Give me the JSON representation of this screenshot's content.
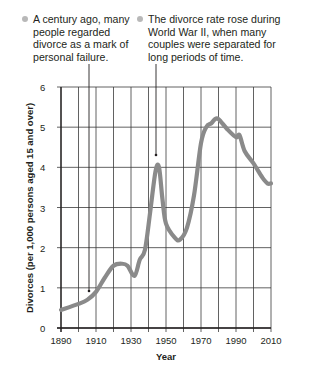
{
  "chart_data": {
    "type": "line",
    "title": "",
    "xlabel": "Year",
    "ylabel": "Divorces (per 1,000 persons aged 15 and over)",
    "xlim": [
      1890,
      2010
    ],
    "ylim": [
      0,
      6
    ],
    "x_ticks": [
      "1890",
      "1910",
      "1930",
      "1950",
      "1970",
      "1990",
      "2010"
    ],
    "y_ticks": [
      "0",
      "1",
      "2",
      "3",
      "4",
      "5",
      "6"
    ],
    "grid": true,
    "grid_x_step": 10,
    "grid_y_step": 1,
    "series": [
      {
        "name": "Divorce rate",
        "color": "#8a8a8a",
        "x": [
          1890,
          1900,
          1905,
          1910,
          1915,
          1920,
          1925,
          1928,
          1932,
          1935,
          1938,
          1941,
          1944,
          1946,
          1948,
          1950,
          1955,
          1958,
          1962,
          1966,
          1970,
          1973,
          1976,
          1978,
          1980,
          1985,
          1990,
          1992,
          1995,
          2000,
          2005,
          2008,
          2010
        ],
        "values": [
          0.45,
          0.6,
          0.7,
          0.9,
          1.25,
          1.55,
          1.6,
          1.55,
          1.3,
          1.7,
          1.95,
          2.9,
          3.9,
          4.0,
          3.2,
          2.6,
          2.25,
          2.2,
          2.5,
          3.3,
          4.6,
          5.0,
          5.1,
          5.2,
          5.2,
          4.95,
          4.75,
          4.8,
          4.4,
          4.1,
          3.75,
          3.6,
          3.6
        ]
      }
    ],
    "annotations": [
      {
        "text": "A century ago, many people regarded divorce as a mark of personal failure.",
        "points_to_year": 1906
      },
      {
        "text": "The divorce rate rose during World War II, when many couples were separated for long periods of time.",
        "points_to_year": 1944
      }
    ]
  },
  "annotations": {
    "a1": "A century ago, many people regarded divorce as a mark of personal failure.",
    "a2": "The divorce rate rose during World War II, when many couples were separated for long periods of time."
  },
  "axes": {
    "xlabel": "Year",
    "ylabel": "Divorces (per 1,000 persons aged 15 and over)"
  }
}
